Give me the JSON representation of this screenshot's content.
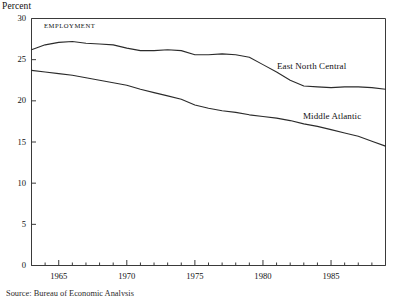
{
  "figure": {
    "y_unit_label": "Percent",
    "panel_tag": "EMPLOYMENT",
    "source_note": "Source: Bureau of Economic Analysis",
    "line_color": "#2b2b2b",
    "axis_color": "#3a3a3a",
    "text_color": "#111111"
  },
  "labels": {
    "east_north_central": "East North Central",
    "middle_atlantic": "Middle Atlantic"
  },
  "ticks": {
    "y": [
      "0",
      "5",
      "10",
      "15",
      "20",
      "25",
      "30"
    ],
    "x": [
      "1965",
      "1970",
      "1975",
      "1980",
      "1985"
    ]
  },
  "chart_data": {
    "type": "line",
    "title": "",
    "subtitle": "EMPLOYMENT",
    "xlabel": "",
    "ylabel": "Percent",
    "xlim": [
      1963,
      1989
    ],
    "ylim": [
      0,
      30
    ],
    "yticks": [
      0,
      5,
      10,
      15,
      20,
      25,
      30
    ],
    "xticks": [
      1965,
      1970,
      1975,
      1980,
      1985
    ],
    "minor_xticks_every": 1,
    "grid": false,
    "legend": "inline-annotations",
    "x": [
      1963,
      1964,
      1965,
      1966,
      1967,
      1968,
      1969,
      1970,
      1971,
      1972,
      1973,
      1974,
      1975,
      1976,
      1977,
      1978,
      1979,
      1980,
      1981,
      1982,
      1983,
      1984,
      1985,
      1986,
      1987,
      1988,
      1989
    ],
    "series": [
      {
        "name": "East North Central",
        "values": [
          26.2,
          26.8,
          27.1,
          27.2,
          27.0,
          26.9,
          26.8,
          26.4,
          26.1,
          26.1,
          26.2,
          26.1,
          25.6,
          25.6,
          25.7,
          25.6,
          25.3,
          24.4,
          23.5,
          22.5,
          21.8,
          21.7,
          21.6,
          21.7,
          21.7,
          21.6,
          21.4
        ],
        "endpoint_value": 21.4
      },
      {
        "name": "Middle Atlantic",
        "values": [
          23.7,
          23.5,
          23.3,
          23.1,
          22.8,
          22.5,
          22.2,
          21.9,
          21.4,
          21.0,
          20.6,
          20.2,
          19.5,
          19.1,
          18.8,
          18.6,
          18.3,
          18.1,
          17.9,
          17.6,
          17.2,
          16.9,
          16.5,
          16.1,
          15.7,
          15.1,
          14.5
        ],
        "endpoint_value": 14.5
      }
    ]
  }
}
